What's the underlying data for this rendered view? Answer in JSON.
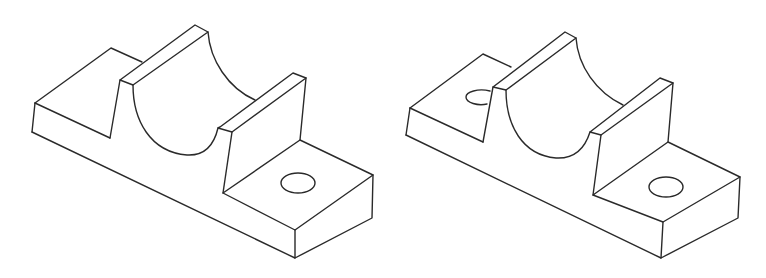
{
  "figure": {
    "stroke_color": "#2a2a2a",
    "background_color": "#ffffff"
  },
  "parts": [
    {
      "label": "Bracket variant A",
      "features": [
        "base plate",
        "left raised block",
        "front rib",
        "semicircular cradle",
        "rear rib",
        "right mounting pad",
        "through hole on right pad"
      ],
      "hole_count_visible": 1
    },
    {
      "label": "Bracket variant B",
      "features": [
        "base plate",
        "left raised block",
        "front rib",
        "semicircular cradle",
        "rear rib",
        "right mounting pad",
        "through hole on right pad",
        "partially hidden hole on left block"
      ],
      "hole_count_visible": 2
    }
  ]
}
